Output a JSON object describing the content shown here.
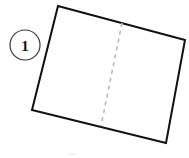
{
  "figure": {
    "background_color": "#ffffff",
    "label_badge": {
      "text": "1",
      "shape": "circle",
      "center_x": 25,
      "center_y": 45,
      "radius": 15,
      "stroke_color": "#3a3a3a",
      "stroke_width": 1.2,
      "fill_color": "#ffffff",
      "text_color": "#121212"
    },
    "sheet": {
      "name": "tilted-rectangle",
      "stroke_color": "#111111",
      "stroke_width": 2,
      "fill_color": "#ffffff",
      "corners": [
        {
          "name": "top-left",
          "x": 58,
          "y": 6
        },
        {
          "name": "top-right",
          "x": 185,
          "y": 40
        },
        {
          "name": "bottom-right",
          "x": 166,
          "y": 143
        },
        {
          "name": "bottom-left",
          "x": 32,
          "y": 110
        }
      ],
      "points_attr": "58,6 185,40 166,143 32,110"
    },
    "fold_line": {
      "name": "dashed-fold-line",
      "stroke_color": "#b9b9b9",
      "stroke_width": 1.6,
      "dash_pattern": "4 4",
      "x1": 122,
      "y1": 23,
      "x2": 101,
      "y2": 126
    },
    "caption_fragment": {
      "text": "...",
      "x": 72,
      "y": 155,
      "color": "#d9d9d9"
    }
  }
}
